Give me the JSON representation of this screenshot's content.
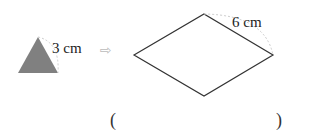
{
  "figure": {
    "small_shape": {
      "type": "equilateral-triangle",
      "side_label": "3 cm",
      "fill": "#808080"
    },
    "arrow": "⇨",
    "large_shape": {
      "type": "rhombus",
      "side_label": "6 cm",
      "stroke": "#333333"
    },
    "answer": {
      "open": "(",
      "close": ")",
      "value": ""
    }
  }
}
